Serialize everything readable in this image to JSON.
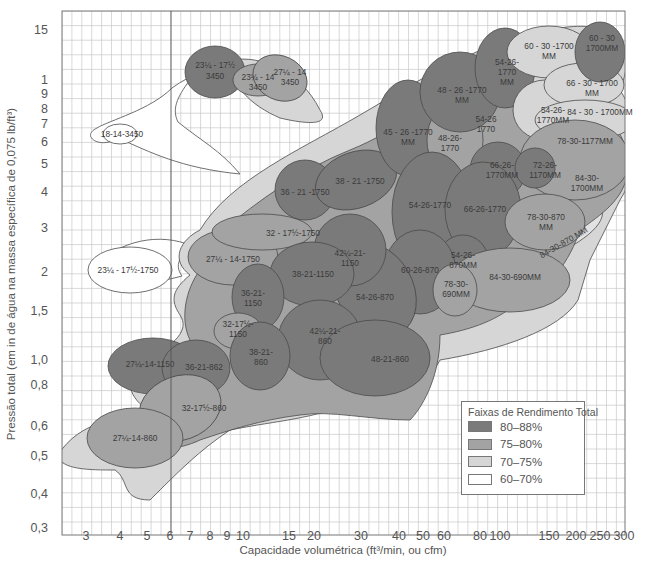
{
  "chart_data": {
    "type": "area",
    "title": "",
    "xlabel": "Capacidade volumétrica (ft³/min, ou cfm)",
    "ylabel": "Pressão total (em in de água na massa específica de 0,075 lb/ft³)",
    "x_scale": "log",
    "y_scale": "log",
    "xlim": [
      2.5,
      300
    ],
    "ylim": [
      0.27,
      18
    ],
    "x_ticks": [
      "3",
      "4",
      "5",
      "6",
      "7",
      "8",
      "9",
      "10",
      "15",
      "20",
      "30",
      "40",
      "50",
      "60",
      "80",
      "100",
      "150",
      "200",
      "250",
      "300"
    ],
    "y_ticks": [
      "15",
      "1",
      "9",
      "8",
      "7",
      "6",
      "5",
      "4",
      "3",
      "2",
      "1,5",
      "1,0",
      "0,8",
      "0,6",
      "0,5",
      "0,4",
      "0,3"
    ],
    "grid": true,
    "legend": {
      "title": "Faixas de Rendimento Total",
      "position": "lower right",
      "entries": [
        {
          "label": "80–88%",
          "color": "#7a7a7a"
        },
        {
          "label": "75–80%",
          "color": "#a3a3a3"
        },
        {
          "label": "70–75%",
          "color": "#d6d6d6"
        },
        {
          "label": "60–70%",
          "color": "#ffffff"
        }
      ]
    },
    "regions": [
      {
        "label": "18-14-3450",
        "band": "60–70%"
      },
      {
        "label": "23¼ - 17½ 3450",
        "band": "80–88%"
      },
      {
        "label": "23¼ - 14 3450",
        "band": "75–80%"
      },
      {
        "label": "27¼ - 14 3450",
        "band": "75–80%"
      },
      {
        "label": "23¼ - 17½-1750",
        "band": "60–70%"
      },
      {
        "label": "27¼ - 14-1750",
        "band": "75–80%"
      },
      {
        "label": "32 - 17½-1750",
        "band": "75–80%"
      },
      {
        "label": "36 - 21 -1750",
        "band": "80–88%"
      },
      {
        "label": "38 - 21 -1750",
        "band": "80–88%"
      },
      {
        "label": "45 - 26 -1770 MM",
        "band": "80–88%"
      },
      {
        "label": "48-26-1770",
        "band": "75–80%"
      },
      {
        "label": "48 - 26 -1770 MM",
        "band": "80–88%"
      },
      {
        "label": "54-26-1770 MM",
        "band": "80–88%"
      },
      {
        "label": "54-26-1770",
        "band": "80–88%"
      },
      {
        "label": "54-26-1770MM",
        "band": "70–75%"
      },
      {
        "label": "60 - 30 -1700 MM",
        "band": "70–75%"
      },
      {
        "label": "60 - 30 1700MM",
        "band": "80–88%"
      },
      {
        "label": "66 - 30 - 1700 MM",
        "band": "70–75%"
      },
      {
        "label": "84 - 30 - 1700MM",
        "band": "70–75%"
      },
      {
        "label": "78-30-1177MM",
        "band": "75–80%"
      },
      {
        "label": "84-30 1700MM",
        "band": "75–80%"
      },
      {
        "label": "66-26 1770MM",
        "band": "80–88%"
      },
      {
        "label": "72-26 1170MM",
        "band": "80–88%"
      },
      {
        "label": "66-26-1770",
        "band": "80–88%"
      },
      {
        "label": "78-30-870 MM",
        "band": "75–80%"
      },
      {
        "label": "84-30-870 MM",
        "band": "70–75%"
      },
      {
        "label": "54-26 870MM",
        "band": "80–88%"
      },
      {
        "label": "60-26-870",
        "band": "80–88%"
      },
      {
        "label": "78-30 690MM",
        "band": "75–80%"
      },
      {
        "label": "84-30-690MM",
        "band": "75–80%"
      },
      {
        "label": "54-26-870",
        "band": "80–88%"
      },
      {
        "label": "42¼-21 1150",
        "band": "80–88%"
      },
      {
        "label": "38-21-1150",
        "band": "80–88%"
      },
      {
        "label": "36-21 1150",
        "band": "80–88%"
      },
      {
        "label": "32-17½ 1150",
        "band": "75–80%"
      },
      {
        "label": "42¼-21 860",
        "band": "80–88%"
      },
      {
        "label": "48-21-860",
        "band": "80–88%"
      },
      {
        "label": "38-21 860",
        "band": "80–88%"
      },
      {
        "label": "27¼-14-1150",
        "band": "80–88%"
      },
      {
        "label": "36-21-860",
        "band": "80–88%"
      },
      {
        "label": "32-17½-860",
        "band": "75–80%"
      },
      {
        "label": "27¼-14-860",
        "band": "75–80%"
      }
    ]
  }
}
